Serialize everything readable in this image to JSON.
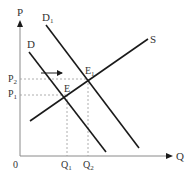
{
  "diagram": {
    "type": "supply-demand",
    "axes": {
      "y_label": "P",
      "x_label": "Q",
      "origin_label": "0"
    },
    "curves": [
      {
        "id": "D",
        "label": "D",
        "sub": ""
      },
      {
        "id": "D1",
        "label": "D",
        "sub": "1"
      },
      {
        "id": "S",
        "label": "S",
        "sub": ""
      }
    ],
    "points": [
      {
        "id": "E",
        "label": "E",
        "sub": ""
      },
      {
        "id": "E1",
        "label": "E",
        "sub": "1"
      }
    ],
    "price_ticks": [
      {
        "label": "P",
        "sub": "2"
      },
      {
        "label": "P",
        "sub": "1"
      }
    ],
    "quantity_ticks": [
      {
        "label": "Q",
        "sub": "1"
      },
      {
        "label": "Q",
        "sub": "2"
      }
    ],
    "shift_arrow": "demand-increase"
  },
  "colors": {
    "line": "#1a1a1a",
    "axis": "#8a8a8a",
    "guide": "#9a9a9a",
    "text": "#333333"
  }
}
